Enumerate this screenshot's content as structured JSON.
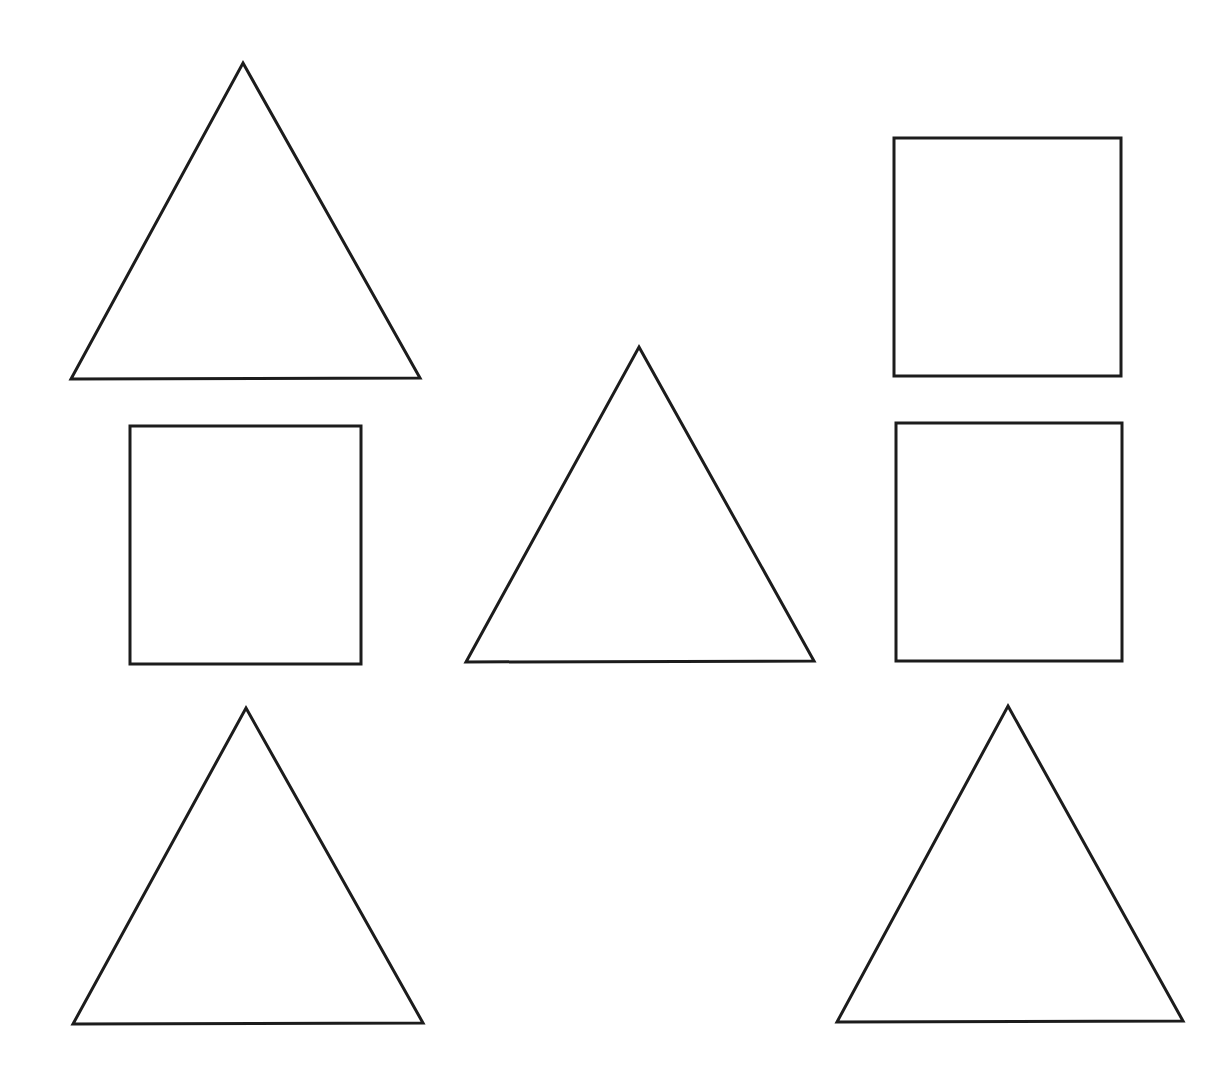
{
  "canvas": {
    "width": 1228,
    "height": 1085,
    "background": "#ffffff",
    "stroke_color": "#1c1c1c",
    "stroke_width": 3
  },
  "shapes": [
    {
      "id": "triangle-top-left",
      "type": "triangle",
      "points": [
        [
          243,
          63
        ],
        [
          420,
          378
        ],
        [
          71,
          379
        ]
      ]
    },
    {
      "id": "square-top-right",
      "type": "rect",
      "x": 894,
      "y": 138,
      "width": 227,
      "height": 238
    },
    {
      "id": "square-middle-left",
      "type": "rect",
      "x": 130,
      "y": 426,
      "width": 231,
      "height": 238
    },
    {
      "id": "triangle-center",
      "type": "triangle",
      "points": [
        [
          639,
          347
        ],
        [
          814,
          661
        ],
        [
          466,
          662
        ]
      ]
    },
    {
      "id": "square-middle-right",
      "type": "rect",
      "x": 896,
      "y": 423,
      "width": 226,
      "height": 238
    },
    {
      "id": "triangle-bottom-left",
      "type": "triangle",
      "points": [
        [
          246,
          708
        ],
        [
          423,
          1023
        ],
        [
          73,
          1024
        ]
      ]
    },
    {
      "id": "triangle-bottom-right",
      "type": "triangle",
      "points": [
        [
          1008,
          706
        ],
        [
          1183,
          1021
        ],
        [
          837,
          1022
        ]
      ]
    }
  ],
  "summary": {
    "triangle_count": 5,
    "square_count": 3
  }
}
